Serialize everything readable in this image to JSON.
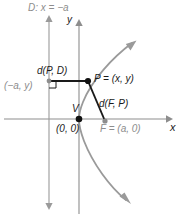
{
  "figure": {
    "kind": "parabola-definition-diagram",
    "title_label": "D: x = -a",
    "axis": {
      "x_label": "x",
      "y_label": "y"
    },
    "labels": {
      "directrix": "D: x = −a",
      "distance_point_directrix": "d(P, D)",
      "foot_of_perpendicular": "(−a, y)",
      "point_p": "P = (x, y)",
      "distance_focus_point": "d(F, P)",
      "vertex_letter": "V",
      "origin": "(0, 0)",
      "focus": "F = (a, 0)",
      "x_axis": "x",
      "y_axis": "y"
    },
    "colors": {
      "curve": "#9a9a9a",
      "axis": "#8d8d8d",
      "directrix": "#9a9a9a",
      "segment": "#1a1a1a",
      "point_dark": "#111111",
      "point_gray": "#8d8d8d",
      "label_dark": "#1a1a1a",
      "label_gray": "#8d8d8d",
      "background": "#ffffff"
    },
    "geometry": {
      "origin_px": [
        79,
        119
      ],
      "point_p_px": [
        88,
        81
      ],
      "focus_px": [
        105,
        121
      ],
      "directrix_x_px": 49,
      "foot_px": [
        49,
        81
      ]
    }
  }
}
